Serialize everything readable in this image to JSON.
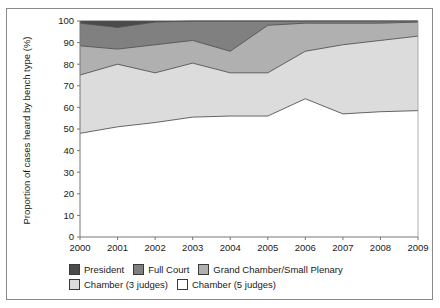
{
  "chart_data": {
    "type": "area",
    "title": "",
    "subtitle": "",
    "xlabel": "",
    "ylabel": "Proportion of cases heard by bench type (%)",
    "categories": [
      "2000",
      "2001",
      "2002",
      "2003",
      "2004",
      "2005",
      "2006",
      "2007",
      "2008",
      "2009"
    ],
    "x": [
      2000,
      2001,
      2002,
      2003,
      2004,
      2005,
      2006,
      2007,
      2008,
      2009
    ],
    "xlim": [
      2000,
      2009
    ],
    "ylim": [
      0,
      100
    ],
    "yticks": [
      0,
      10,
      20,
      30,
      40,
      50,
      60,
      70,
      80,
      90,
      100
    ],
    "ytick_labels": [
      "0",
      "10",
      "20",
      "30",
      "40",
      "50",
      "60",
      "70",
      "80",
      "90",
      "100"
    ],
    "grid": false,
    "stacked": true,
    "stack_order_bottom_to_top": [
      "Chamber (5 judges)",
      "Chamber (3 judges)",
      "Grand Chamber/Small Plenary",
      "Full Court",
      "President"
    ],
    "legend_position": "bottom",
    "series": [
      {
        "name": "Chamber (5 judges)",
        "color": "#ffffff",
        "values": [
          48,
          51,
          53,
          55.5,
          56,
          56,
          64,
          57,
          58,
          58.5
        ],
        "cumulative_top": [
          48,
          51,
          53,
          55.5,
          56,
          56,
          64,
          57,
          58,
          58.5
        ]
      },
      {
        "name": "Chamber (3 judges)",
        "color": "#dcdcdc",
        "values": [
          27,
          29,
          23,
          25,
          20,
          20,
          22,
          32,
          33,
          34.5
        ],
        "cumulative_top": [
          75,
          80,
          76,
          80.5,
          76,
          76,
          86,
          89,
          91,
          93
        ]
      },
      {
        "name": "Grand Chamber/Small Plenary",
        "color": "#b0b0b0",
        "values": [
          13.5,
          7,
          13,
          10.5,
          10,
          22,
          13,
          10,
          8,
          6.5
        ],
        "cumulative_top": [
          88.5,
          87,
          89,
          91,
          86,
          98,
          99,
          99,
          99,
          99.5
        ]
      },
      {
        "name": "Full Court",
        "color": "#808080",
        "values": [
          10.5,
          10,
          10.5,
          9,
          14,
          2,
          1,
          1,
          1,
          0.5
        ],
        "cumulative_top": [
          99,
          97,
          99.5,
          100,
          100,
          100,
          100,
          100,
          100,
          100
        ]
      },
      {
        "name": "President",
        "color": "#4a4a4a",
        "values": [
          1,
          3,
          0.5,
          0,
          0,
          0,
          0,
          0,
          0,
          0
        ],
        "cumulative_top": [
          100,
          100,
          100,
          100,
          100,
          100,
          100,
          100,
          100,
          100
        ]
      }
    ]
  },
  "legend": {
    "row1": [
      {
        "label": "President",
        "color": "#4a4a4a"
      },
      {
        "label": "Full Court",
        "color": "#808080"
      },
      {
        "label": "Grand Chamber/Small Plenary",
        "color": "#b0b0b0"
      }
    ],
    "row2": [
      {
        "label": "Chamber (3 judges)",
        "color": "#dcdcdc"
      },
      {
        "label": "Chamber (5 judges)",
        "color": "#ffffff"
      }
    ]
  }
}
